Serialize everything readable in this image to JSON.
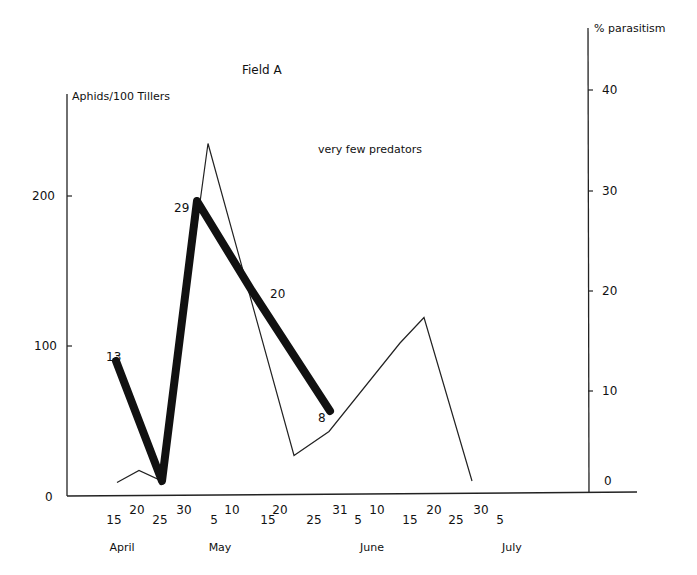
{
  "chart_data": {
    "type": "line",
    "title": "Field A",
    "annotation": "very few predators",
    "ylabel_left": "Aphids/100 Tillers",
    "ylabel_right": "% parasitism",
    "ylim_left": [
      0,
      265
    ],
    "ylim_right": [
      0,
      46
    ],
    "yticks_left": [
      0,
      100,
      200
    ],
    "yticks_right": [
      0,
      10,
      20,
      30,
      40
    ],
    "xtick_labels": [
      {
        "label": "15",
        "x": 114,
        "row": "low"
      },
      {
        "label": "20",
        "x": 137,
        "row": "high"
      },
      {
        "label": "25",
        "x": 160,
        "row": "low"
      },
      {
        "label": "30",
        "x": 184,
        "row": "high"
      },
      {
        "label": "5",
        "x": 214,
        "row": "low"
      },
      {
        "label": "10",
        "x": 232,
        "row": "high"
      },
      {
        "label": "15",
        "x": 268,
        "row": "low"
      },
      {
        "label": "20",
        "x": 280,
        "row": "high"
      },
      {
        "label": "25",
        "x": 314,
        "row": "low"
      },
      {
        "label": "31",
        "x": 340,
        "row": "high"
      },
      {
        "label": "5",
        "x": 358,
        "row": "low"
      },
      {
        "label": "10",
        "x": 377,
        "row": "high"
      },
      {
        "label": "15",
        "x": 410,
        "row": "low"
      },
      {
        "label": "20",
        "x": 434,
        "row": "high"
      },
      {
        "label": "25",
        "x": 456,
        "row": "low"
      },
      {
        "label": "30",
        "x": 481,
        "row": "high"
      },
      {
        "label": "5",
        "x": 500,
        "row": "low"
      }
    ],
    "months": [
      {
        "label": "April",
        "x": 122
      },
      {
        "label": "May",
        "x": 220
      },
      {
        "label": "June",
        "x": 372
      },
      {
        "label": "July",
        "x": 512
      }
    ],
    "series": [
      {
        "name": "Aphids/100 Tillers",
        "axis": "left",
        "style": "thin",
        "dates": [
          "Apr 17",
          "Apr 22",
          "Apr 26",
          "May 5",
          "May 23",
          "May 31",
          "Jun 12",
          "Jun 18",
          "Jun 29"
        ],
        "values": [
          9,
          17,
          10,
          235,
          27,
          43,
          102,
          119,
          10
        ],
        "px": [
          117,
          139,
          162,
          208,
          294,
          329,
          400,
          424,
          472
        ]
      },
      {
        "name": "% parasitism",
        "axis": "right",
        "style": "thick",
        "dates": [
          "Apr 16",
          "Apr 26",
          "May 3",
          "May 15",
          "May 30"
        ],
        "values": [
          13,
          1,
          29,
          20,
          8
        ],
        "point_labels": [
          "13",
          "",
          "29",
          "20",
          "8"
        ],
        "px": [
          116,
          162,
          197,
          252,
          330
        ]
      }
    ],
    "grid": false,
    "legend": "none"
  }
}
